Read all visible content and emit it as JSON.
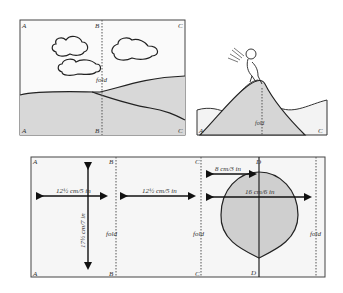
{
  "top_left_panel": {
    "corners": {
      "top_left": "A",
      "top_mid": "B",
      "top_right": "C",
      "bottom_left": "A",
      "bottom_mid": "B",
      "bottom_right": "C"
    },
    "fold_label": "fold"
  },
  "top_right_panel": {
    "corners": {
      "bottom_left": "A",
      "bottom_right": "C"
    },
    "fold_label": "fold"
  },
  "bottom_panel": {
    "corners": {
      "a_top": "A",
      "a_bottom": "A",
      "b_top": "B",
      "b_bottom": "B",
      "c_top": "C",
      "c_bottom": "C",
      "d_top": "D",
      "d_bottom": "D"
    },
    "fold_labels": [
      "fold",
      "fold",
      "fold"
    ],
    "dimensions": {
      "width_1": "12½ cm/5 in",
      "height_1": "17½ cm/7 in",
      "width_2": "12½ cm/5 in",
      "radius": "8 cm/3 in",
      "diameter": "16 cm/6 in"
    }
  },
  "colors": {
    "line": "#222222",
    "shade": "#d4d4d4",
    "panel_bg": "#f7f7f7"
  }
}
